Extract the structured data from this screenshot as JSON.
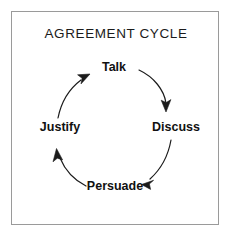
{
  "figure": {
    "title": "AGREEMENT CYCLE",
    "background_color": "#ffffff",
    "border_color": "#9a9a9a",
    "stroke_color": "#1b1b1b",
    "text_color": "#111111"
  },
  "diagram": {
    "type": "cycle",
    "direction": "clockwise",
    "node_count": 4,
    "nodes": [
      {
        "id": "talk",
        "label": "Talk",
        "position": "top"
      },
      {
        "id": "discuss",
        "label": "Discuss",
        "position": "right"
      },
      {
        "id": "persuade",
        "label": "Persuade",
        "position": "bottom"
      },
      {
        "id": "justify",
        "label": "Justify",
        "position": "left"
      }
    ],
    "edges": [
      {
        "from": "talk",
        "to": "discuss",
        "style": "curved-arrow"
      },
      {
        "from": "discuss",
        "to": "persuade",
        "style": "curved-arrow"
      },
      {
        "from": "persuade",
        "to": "justify",
        "style": "curved-arrow"
      },
      {
        "from": "justify",
        "to": "talk",
        "style": "curved-arrow"
      }
    ]
  }
}
